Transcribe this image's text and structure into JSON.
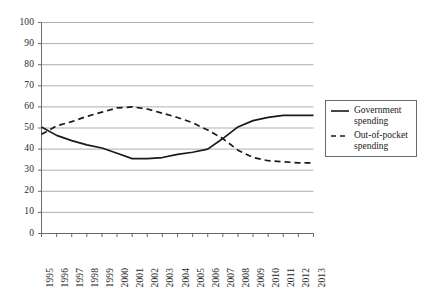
{
  "chart_data": {
    "type": "line",
    "title": "",
    "subtitle": "",
    "xlabel": "",
    "ylabel": "",
    "x": [
      "1995",
      "1996",
      "1997",
      "1998",
      "1999",
      "2000",
      "2001",
      "2002",
      "2003",
      "2004",
      "2005",
      "2006",
      "2007",
      "2008",
      "2009",
      "2010",
      "2011",
      "2012",
      "2013"
    ],
    "categories": [
      "1995",
      "1996",
      "1997",
      "1998",
      "1999",
      "2000",
      "2001",
      "2002",
      "2003",
      "2004",
      "2005",
      "2006",
      "2007",
      "2008",
      "2009",
      "2010",
      "2011",
      "2012",
      "2013"
    ],
    "series": [
      {
        "name": "Government spending",
        "style": "solid",
        "color": "#1a1a1a",
        "values": [
          50.5,
          46.5,
          44,
          42,
          40.5,
          38,
          35.5,
          35.5,
          36,
          37.5,
          38.5,
          40,
          45,
          50.5,
          53.5,
          55,
          56,
          56,
          56
        ]
      },
      {
        "name": "Out-of-pocket spending",
        "style": "dashed",
        "color": "#1a1a1a",
        "values": [
          47,
          51,
          53,
          55.5,
          57.5,
          59.5,
          60,
          59,
          57,
          55,
          52.5,
          49,
          45,
          39.5,
          36,
          34.5,
          34,
          33.5,
          33.5
        ]
      }
    ],
    "ylim": [
      0,
      100
    ],
    "yticks": [
      0,
      10,
      20,
      30,
      40,
      50,
      60,
      70,
      80,
      90,
      100
    ],
    "ytick_labels": [
      "0",
      "10",
      "20",
      "30",
      "40",
      "50",
      "60",
      "70",
      "80",
      "90",
      "100"
    ],
    "grid": true,
    "grid_axis": "y",
    "grid_color": "#a6a6a6",
    "legend_position": "right",
    "background": "#ffffff",
    "axis_color": "#6a6a6a"
  },
  "legend": {
    "entries": [
      {
        "label_line1": "Government",
        "label_line2": "spending",
        "key": "solid-line-key"
      },
      {
        "label_line1": "Out-of-pocket",
        "label_line2": "spending",
        "key": "dashed-line-key"
      }
    ]
  }
}
